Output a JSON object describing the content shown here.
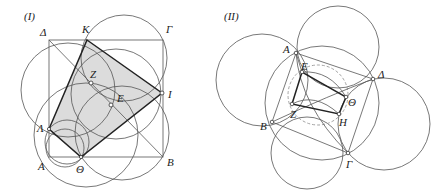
{
  "figures": [
    {
      "id": "fig1",
      "title": "(I)",
      "labels": {
        "A": "Α",
        "B": "Β",
        "G": "Γ",
        "D": "Δ",
        "K": "Κ",
        "I": "Ι",
        "Th": "Θ",
        "L": "Λ",
        "Z": "Ζ",
        "E": "Ε"
      }
    },
    {
      "id": "fig2",
      "title": "(II)",
      "labels": {
        "A": "Α",
        "B": "Β",
        "G": "Γ",
        "D": "Δ",
        "E": "Ε",
        "Z": "Ζ",
        "H": "Η",
        "Th": "Θ"
      }
    }
  ],
  "colors": {
    "shade": "#dcdcdc",
    "line": "#555555",
    "thick": "#222222",
    "dashed": "#999999"
  }
}
